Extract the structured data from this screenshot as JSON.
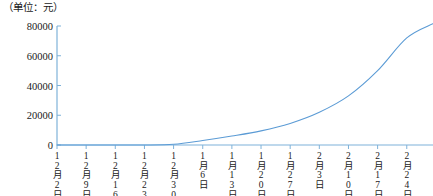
{
  "chart_data": {
    "type": "line",
    "title": "（单位：元）",
    "xlabel": "",
    "ylabel": "",
    "ylim": [
      0,
      80000
    ],
    "yticks": [
      0,
      20000,
      40000,
      60000,
      80000
    ],
    "ytick_labels": [
      "0",
      "20000",
      "40000",
      "60000",
      "80000"
    ],
    "grid": false,
    "legend": "none",
    "categories": [
      "12月2日",
      "12月9日",
      "12月16日",
      "12月23日",
      "12月30日",
      "1月6日",
      "1月13日",
      "1月20日",
      "1月27日",
      "2月3日",
      "2月10日",
      "2月17日",
      "2月24日"
    ],
    "values": [
      0,
      0,
      0,
      0,
      500,
      3000,
      6000,
      9500,
      14500,
      22000,
      33000,
      50000,
      72000
    ],
    "series": [
      {
        "name": "累计金额",
        "color": "#5b9bd5",
        "values": [
          0,
          0,
          0,
          0,
          500,
          3000,
          6000,
          9500,
          14500,
          22000,
          33000,
          50000,
          72000
        ]
      }
    ]
  },
  "axes": {
    "unit_note": "（单位：元）",
    "y_tick_labels": [
      "80000",
      "60000",
      "40000",
      "20000",
      "0"
    ],
    "x_tick_labels": [
      "12月2日",
      "12月9日",
      "12月16日",
      "12月23日",
      "12月30日",
      "1月6日",
      "1月13日",
      "1月20日",
      "1月27日",
      "2月3日",
      "2月10日",
      "2月17日",
      "2月24日"
    ]
  },
  "colors": {
    "axis": "#7fb2d9",
    "line": "#5b9bd5",
    "text": "#1a1a1a",
    "background": "#ffffff"
  }
}
